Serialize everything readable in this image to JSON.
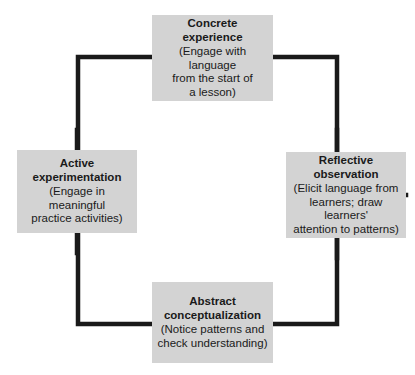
{
  "diagram": {
    "type": "experiential-learning-cycle",
    "background_color": "#ffffff",
    "node_fill_color": "#d3d3d3",
    "connector_color": "#1a1a1a",
    "text_color": "#1a1a1a",
    "nodes": [
      {
        "id": "concrete-experience",
        "title": "Concrete\nexperience",
        "description": "(Engage with language\nfrom the start of\na lesson)",
        "position": "top"
      },
      {
        "id": "reflective-observation",
        "title": "Reflective\nobservation",
        "description": "(Elicit language from\nlearners; draw learners'\nattention to patterns)",
        "position": "right"
      },
      {
        "id": "abstract-conceptualization",
        "title": "Abstract\nconceptualization",
        "description": "(Notice patterns and\ncheck understanding)",
        "position": "bottom"
      },
      {
        "id": "active-experimentation",
        "title": "Active\nexperimentation",
        "description": "(Engage in meaningful\npractice activities)",
        "position": "left"
      }
    ]
  }
}
